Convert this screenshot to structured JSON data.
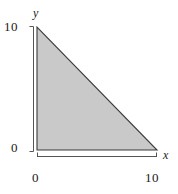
{
  "chart_data": {
    "type": "area",
    "title": "",
    "xlabel": "x",
    "ylabel": "y",
    "xlim": [
      0,
      10
    ],
    "ylim": [
      0,
      10
    ],
    "grid": false,
    "legend": null,
    "x_ticks": [
      "0",
      "10"
    ],
    "y_ticks": [
      "0",
      "10"
    ],
    "x_tick_values": [
      0,
      10
    ],
    "y_tick_values": [
      0,
      10
    ],
    "shaded_region": {
      "name": "triangle",
      "description": "Shaded right triangle region bounded by x = 0, y = 0, and the line x + y = 10",
      "vertices": [
        [
          0,
          0
        ],
        [
          0,
          10
        ],
        [
          10,
          0
        ]
      ],
      "boundary_line": "x + y = 10",
      "fill_color": "#c9c9c9",
      "edge_color": "#3b3b3b"
    },
    "series": [
      {
        "name": "x + y = 10",
        "x": [
          0,
          10
        ],
        "y": [
          10,
          0
        ]
      }
    ]
  },
  "axes": {
    "y": {
      "name": "y",
      "top_label": "10",
      "bottom_label": "0"
    },
    "x": {
      "name": "x",
      "left_label": "0",
      "right_label": "10"
    }
  },
  "colors": {
    "fill": "#c9c9c9",
    "edge": "#3b3b3b",
    "axis": "#555555",
    "text": "#1a1a1a",
    "background": "#ffffff"
  }
}
